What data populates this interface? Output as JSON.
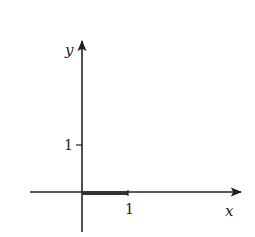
{
  "diagram": {
    "type": "coordinate-axes",
    "axes": {
      "x_label": "x",
      "y_label": "y",
      "x_tick_label": "1",
      "y_tick_label": "1"
    },
    "highlighted_segment": {
      "description": "thick segment on x-axis from 0 to 1",
      "from": [
        0,
        0
      ],
      "to": [
        1,
        0
      ]
    },
    "colors": {
      "axis": "#222222",
      "segment": "#333333"
    }
  }
}
